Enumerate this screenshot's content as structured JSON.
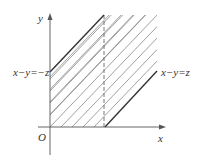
{
  "diagram": {
    "type": "region-plot",
    "axes": {
      "x_label": "x",
      "y_label": "y",
      "origin_label": "O"
    },
    "lines": [
      {
        "id": "upper",
        "label": "x−y=−z",
        "equation": "x - y = -z"
      },
      {
        "id": "lower",
        "label": "x−y=z",
        "equation": "x - y = z"
      }
    ],
    "dashed_line": "x = z (vertical boundary)",
    "shaded_region": "first quadrant strip between x−y=−z and x−y=z",
    "colors": {
      "axis": "#555555",
      "boundary": "#333333",
      "hatch": "#888888",
      "text": "#333333"
    }
  }
}
